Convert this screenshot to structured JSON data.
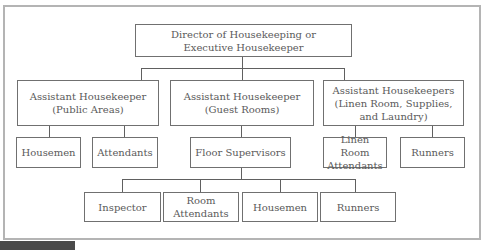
{
  "chart": {
    "title_box": {
      "lines": [
        "Director of Housekeeping or",
        "Executive Housekeeper"
      ]
    },
    "level2": [
      {
        "id": "public-areas",
        "lines": [
          "Assistant Housekeeper",
          "(Public Areas)"
        ]
      },
      {
        "id": "guest-rooms",
        "lines": [
          "Assistant Housekeeper",
          "(Guest Rooms)"
        ]
      },
      {
        "id": "linen-room",
        "lines": [
          "Assistant Housekeepers",
          "(Linen Room, Supplies,",
          "and Laundry)"
        ]
      }
    ],
    "level3": [
      {
        "id": "housemen-public",
        "parent": "public-areas",
        "lines": [
          "Housemen"
        ]
      },
      {
        "id": "attendants-public",
        "parent": "public-areas",
        "lines": [
          "Attendants"
        ]
      },
      {
        "id": "floor-supervisors",
        "parent": "guest-rooms",
        "lines": [
          "Floor Supervisors"
        ]
      },
      {
        "id": "linen-room-attendants",
        "parent": "linen-room",
        "lines": [
          "Linen Room",
          "Attendants"
        ]
      },
      {
        "id": "runners-linen",
        "parent": "linen-room",
        "lines": [
          "Runners"
        ]
      }
    ],
    "level4": [
      {
        "id": "inspector",
        "parent": "floor-supervisors",
        "lines": [
          "Inspector"
        ]
      },
      {
        "id": "room-attendants",
        "parent": "floor-supervisors",
        "lines": [
          "Room",
          "Attendants"
        ]
      },
      {
        "id": "housemen-guest",
        "parent": "floor-supervisors",
        "lines": [
          "Housemen"
        ]
      },
      {
        "id": "runners-guest",
        "parent": "floor-supervisors",
        "lines": [
          "Runners"
        ]
      }
    ]
  },
  "colors": {
    "frame_border": "#b4b4b4",
    "box_border": "#707070",
    "text": "#5a5a5a",
    "tab": "#4a4a4a"
  }
}
